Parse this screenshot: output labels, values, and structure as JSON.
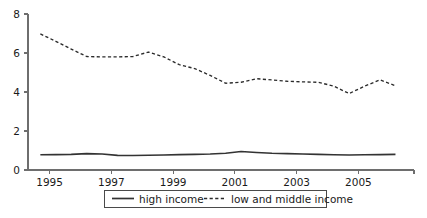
{
  "chart_data": {
    "type": "line",
    "title": "",
    "subtitle": "",
    "xlabel": "",
    "ylabel": "",
    "xlim": [
      1993.8,
      2006.3
    ],
    "ylim": [
      0,
      8
    ],
    "grid": false,
    "legend_position": "bottom-center",
    "x": [
      1994.2,
      1994.7,
      1995.2,
      1995.7,
      1996.2,
      1996.7,
      1997.2,
      1997.7,
      1998.2,
      1998.7,
      1999.2,
      1999.7,
      2000.2,
      2000.7,
      2001.2,
      2001.7,
      2002.2,
      2002.7,
      2003.2,
      2003.7,
      2004.2,
      2004.7,
      2005.2,
      2005.7
    ],
    "y_ticks": [
      0,
      2,
      4,
      6,
      8
    ],
    "y_tick_labels": [
      "0",
      "2",
      "4",
      "6",
      "8"
    ],
    "x_ticks": [
      1994.5,
      1996.5,
      1998.5,
      2000.5,
      2002.5,
      2004.5
    ],
    "x_tick_labels": [
      "1995",
      "1997",
      "1999",
      "2001",
      "2003",
      "2005"
    ],
    "series": [
      {
        "name": "high income",
        "style": "solid",
        "color": "#333333",
        "values": [
          0.78,
          0.79,
          0.8,
          0.84,
          0.82,
          0.75,
          0.74,
          0.76,
          0.77,
          0.79,
          0.8,
          0.82,
          0.86,
          0.95,
          0.9,
          0.86,
          0.84,
          0.82,
          0.8,
          0.78,
          0.77,
          0.78,
          0.79,
          0.8
        ]
      },
      {
        "name": "low and middle income",
        "style": "dashed",
        "color": "#2b2b2b",
        "values": [
          6.98,
          6.6,
          6.2,
          5.82,
          5.8,
          5.8,
          5.82,
          6.05,
          5.8,
          5.4,
          5.2,
          4.85,
          4.45,
          4.5,
          4.68,
          4.62,
          4.55,
          4.52,
          4.5,
          4.3,
          3.92,
          4.3,
          4.62,
          4.32
        ]
      }
    ]
  },
  "legend": {
    "items": [
      {
        "label": "high income",
        "style": "solid"
      },
      {
        "label": "low and middle income",
        "style": "dashed"
      }
    ]
  }
}
